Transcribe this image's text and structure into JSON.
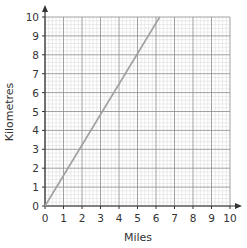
{
  "chart_data": {
    "type": "line",
    "title": "",
    "xlabel": "Miles",
    "ylabel": "Kilometres",
    "xlim": [
      0,
      10
    ],
    "ylim": [
      0,
      10
    ],
    "x_ticks": [
      0,
      1,
      2,
      3,
      4,
      5,
      6,
      7,
      8,
      9,
      10
    ],
    "y_ticks": [
      0,
      1,
      2,
      3,
      4,
      5,
      6,
      7,
      8,
      9,
      10
    ],
    "grid": true,
    "minor_grid_divisions": 5,
    "legend": null,
    "series": [
      {
        "name": "Miles to Kilometres",
        "x": [
          0,
          6.2
        ],
        "y": [
          0,
          10
        ],
        "color": "#a0a0a0"
      }
    ]
  },
  "colors": {
    "major_grid": "#8a8a8a",
    "minor_grid": "#cfcfcf",
    "axis": "#333333",
    "line": "#a0a0a0"
  }
}
